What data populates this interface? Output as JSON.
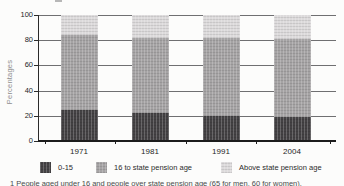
{
  "figure": {
    "footnote": "1 People aged under 16 and people over state pension age (65 for men, 60 for women).",
    "colors": {
      "background": "#fcfcfb",
      "grid": "#6f6f71",
      "axis": "#1c1c1c",
      "text": "#1f1f1f",
      "muted_text": "#8e8e8e"
    }
  },
  "chart_data": {
    "type": "bar",
    "stacked": true,
    "title": "",
    "categories": [
      "1971",
      "1981",
      "1991",
      "2004"
    ],
    "series": [
      {
        "name": "0-15",
        "values": [
          25,
          22,
          20,
          19
        ],
        "color": "#434143"
      },
      {
        "name": "16 to state pension age",
        "values": [
          59,
          60,
          62,
          62
        ],
        "color": "#a5a3a4"
      },
      {
        "name": "Above state pension age",
        "values": [
          16,
          18,
          18,
          19
        ],
        "color": "#dcdadb"
      }
    ],
    "xlabel": "",
    "ylabel": "Percentages",
    "ylim": [
      0,
      100
    ],
    "yticks": [
      0,
      20,
      40,
      60,
      80,
      100
    ],
    "grid": true,
    "legend_position": "bottom"
  }
}
